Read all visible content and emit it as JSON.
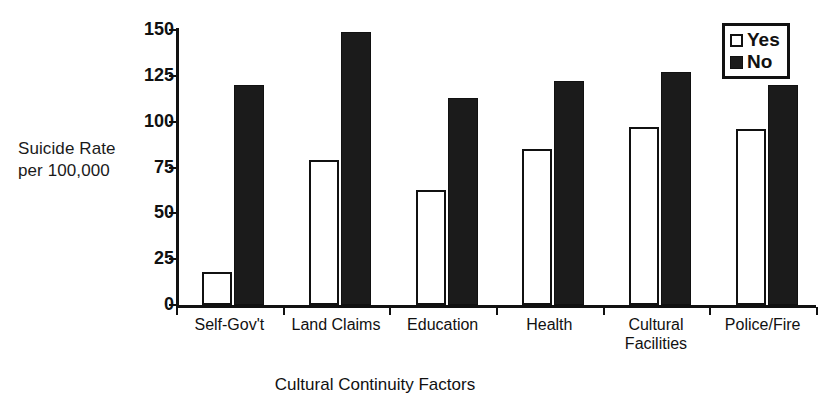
{
  "chart_data": {
    "type": "bar",
    "title": "",
    "xlabel": "Cultural Continuity Factors",
    "ylabel": "Suicide Rate per 100,000",
    "ylabel_lines": [
      "Suicide Rate",
      "per 100,000"
    ],
    "categories": [
      "Self-Gov't",
      "Land Claims",
      "Education",
      "Health",
      "Cultural Facilities",
      "Police/Fire"
    ],
    "category_lines": [
      [
        "Self-Gov't"
      ],
      [
        "Land Claims"
      ],
      [
        "Education"
      ],
      [
        "Health"
      ],
      [
        "Cultural",
        "Facilities"
      ],
      [
        "Police/Fire"
      ]
    ],
    "series": [
      {
        "name": "Yes",
        "color": "#ffffff",
        "edge_color": "#111111",
        "values": [
          18,
          79,
          63,
          85,
          97,
          96
        ]
      },
      {
        "name": "No",
        "color": "#1b1b1b",
        "edge_color": "#111111",
        "values": [
          120,
          149,
          113,
          122,
          127,
          120
        ]
      }
    ],
    "ylim": [
      0,
      150
    ],
    "yticks": [
      0,
      25,
      50,
      75,
      100,
      125,
      150
    ],
    "ytick_labels": [
      "0",
      "25",
      "50",
      "75",
      "100",
      "125",
      "150"
    ],
    "grid": false,
    "legend_position": "top-right",
    "legend_entries": [
      {
        "label": "Yes",
        "swatch": "open-square"
      },
      {
        "label": "No",
        "swatch": "filled-square"
      }
    ]
  }
}
